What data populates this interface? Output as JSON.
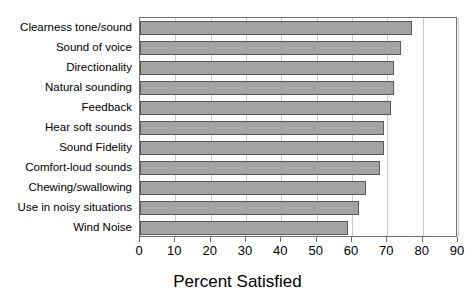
{
  "chart_data": {
    "type": "bar",
    "orientation": "horizontal",
    "title": "",
    "xlabel": "Percent Satisfied",
    "ylabel": "",
    "xlim": [
      0,
      90
    ],
    "xticks": [
      0,
      10,
      20,
      30,
      40,
      50,
      60,
      70,
      80,
      90
    ],
    "grid": true,
    "legend": false,
    "categories": [
      "Clearness tone/sound",
      "Sound of voice",
      "Directionality",
      "Natural sounding",
      "Feedback",
      "Hear soft sounds",
      "Sound Fidelity",
      "Comfort-loud sounds",
      "Chewing/swallowing",
      "Use in noisy situations",
      "Wind Noise"
    ],
    "values": [
      77,
      74,
      72,
      72,
      71,
      69,
      69,
      68,
      64,
      62,
      59
    ],
    "colors": {
      "bar_fill": "#a3a3a3",
      "bar_border": "#595959",
      "gridline": "#c8c8c8",
      "axis": "#6e6e6e",
      "text": "#000000",
      "background": "#ffffff"
    }
  }
}
